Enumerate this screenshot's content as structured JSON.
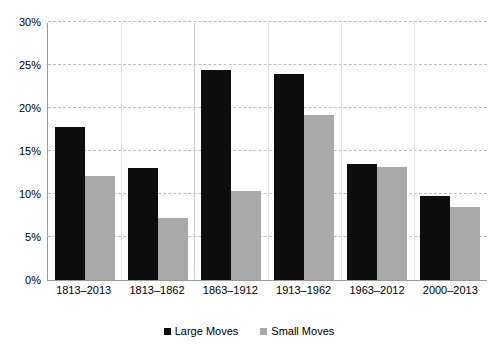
{
  "chart_data": {
    "type": "bar",
    "title": "",
    "subtitle": "",
    "xlabel": "",
    "ylabel": "",
    "categories": [
      "1813–2013",
      "1813–1862",
      "1863–1912",
      "1913–1962",
      "1963–2012",
      "2000–2013"
    ],
    "series": [
      {
        "name": "Large Moves",
        "color": "#0d0d0d",
        "values": [
          17.8,
          13.0,
          24.4,
          23.9,
          13.5,
          9.8
        ]
      },
      {
        "name": "Small Moves",
        "color": "#a9a9a9",
        "values": [
          12.1,
          7.2,
          10.3,
          19.2,
          13.1,
          8.5
        ]
      }
    ],
    "ylim": [
      0,
      30
    ],
    "ytick_values": [
      0,
      5,
      10,
      15,
      20,
      25,
      30
    ],
    "ytick_labels": [
      "0%",
      "5%",
      "10%",
      "15%",
      "20%",
      "25%",
      "30%"
    ],
    "grid": {
      "horizontal": true,
      "horizontal_style": "dashed",
      "vertical": true,
      "vertical_style": "light-solid"
    },
    "legend": {
      "position": "bottom-center",
      "entries": [
        "Large Moves",
        "Small Moves"
      ]
    },
    "value_format": "percent",
    "background_color": "#ffffff",
    "axis_color": "#9a9a9a",
    "gridline_color": "#bdbdbd"
  }
}
